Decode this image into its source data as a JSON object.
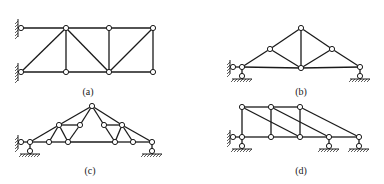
{
  "figure": {
    "panels": [
      {
        "id": "a",
        "label": "(a)",
        "nodes": [
          [
            21,
            28
          ],
          [
            66,
            28
          ],
          [
            109,
            28
          ],
          [
            153,
            28
          ],
          [
            21,
            72
          ],
          [
            66,
            72
          ],
          [
            109,
            72
          ],
          [
            153,
            72
          ]
        ],
        "members": [
          [
            0,
            1
          ],
          [
            1,
            2
          ],
          [
            2,
            3
          ],
          [
            4,
            5
          ],
          [
            5,
            6
          ],
          [
            6,
            7
          ],
          [
            1,
            5
          ],
          [
            2,
            6
          ],
          [
            3,
            7
          ],
          [
            4,
            1
          ],
          [
            1,
            6
          ],
          [
            6,
            3
          ]
        ],
        "supports": [
          {
            "type": "wall-pin",
            "node": 0
          },
          {
            "type": "wall-pin",
            "node": 4
          }
        ]
      },
      {
        "id": "b",
        "label": "(b)",
        "nodes": [
          [
            242,
            67
          ],
          [
            270,
            49
          ],
          [
            301,
            28
          ],
          [
            332,
            49
          ],
          [
            360,
            67
          ],
          [
            301,
            68
          ]
        ],
        "members": [
          [
            0,
            1
          ],
          [
            1,
            2
          ],
          [
            2,
            3
          ],
          [
            3,
            4
          ],
          [
            0,
            5
          ],
          [
            5,
            4
          ],
          [
            1,
            5
          ],
          [
            2,
            5
          ],
          [
            3,
            5
          ]
        ],
        "supports": [
          {
            "type": "pin-roller-left",
            "node": 0
          },
          {
            "type": "roller",
            "node": 4
          }
        ]
      },
      {
        "id": "c",
        "label": "(c)",
        "nodes": [
          [
            30,
            142
          ],
          [
            49,
            142
          ],
          [
            68,
            142
          ],
          [
            59,
            125
          ],
          [
            80,
            125
          ],
          [
            92,
            106
          ],
          [
            104,
            125
          ],
          [
            122,
            125
          ],
          [
            115,
            142
          ],
          [
            133,
            142
          ],
          [
            152,
            142
          ]
        ],
        "members": [
          [
            0,
            1
          ],
          [
            1,
            2
          ],
          [
            2,
            8
          ],
          [
            8,
            9
          ],
          [
            9,
            10
          ],
          [
            0,
            3
          ],
          [
            3,
            5
          ],
          [
            5,
            7
          ],
          [
            7,
            10
          ],
          [
            3,
            4
          ],
          [
            6,
            7
          ],
          [
            5,
            4
          ],
          [
            5,
            6
          ],
          [
            3,
            1
          ],
          [
            3,
            2
          ],
          [
            4,
            2
          ],
          [
            6,
            8
          ],
          [
            7,
            8
          ],
          [
            7,
            9
          ]
        ],
        "supports": [
          {
            "type": "pin-roller-left",
            "node": 0
          },
          {
            "type": "roller",
            "node": 10
          }
        ]
      },
      {
        "id": "d",
        "label": "(d)",
        "nodes": [
          [
            242,
            107
          ],
          [
            271,
            107
          ],
          [
            300,
            107
          ],
          [
            242,
            137
          ],
          [
            271,
            137
          ],
          [
            300,
            137
          ],
          [
            329,
            137
          ],
          [
            359,
            137
          ]
        ],
        "members": [
          [
            0,
            1
          ],
          [
            1,
            2
          ],
          [
            3,
            4
          ],
          [
            4,
            5
          ],
          [
            5,
            6
          ],
          [
            6,
            7
          ],
          [
            0,
            3
          ],
          [
            1,
            4
          ],
          [
            2,
            5
          ],
          [
            0,
            5
          ],
          [
            1,
            6
          ],
          [
            2,
            7
          ]
        ],
        "supports": [
          {
            "type": "pin-roller-left",
            "node": 3
          },
          {
            "type": "roller",
            "node": 6
          },
          {
            "type": "roller",
            "node": 7
          }
        ]
      }
    ],
    "label_positions": {
      "a": [
        88,
        92
      ],
      "b": [
        301,
        92
      ],
      "c": [
        90,
        171
      ],
      "d": [
        301,
        171
      ]
    },
    "colors": {
      "line": "#1a1a1a",
      "node_fill": "#ffffff",
      "background": "#ffffff"
    }
  }
}
